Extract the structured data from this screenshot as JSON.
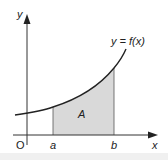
{
  "diagram": {
    "curve_label": "y = f(x)",
    "region_label": "A",
    "axes": {
      "x_label": "x",
      "y_label": "y",
      "origin_label": "O"
    },
    "bounds": {
      "lower_label": "a",
      "upper_label": "b"
    },
    "colors": {
      "axis": "#333333",
      "curve": "#222222",
      "shade": "#d9d9d9",
      "bound_line": "#555555"
    }
  }
}
